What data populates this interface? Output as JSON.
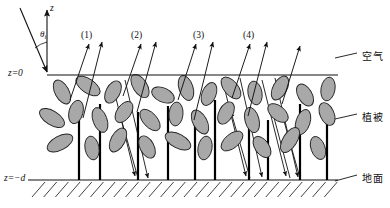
{
  "figure": {
    "type": "schematic-diagram",
    "width": 390,
    "height": 208,
    "background": "#ffffff",
    "stroke_color": "#1a1a1a",
    "leaf_fill": "#a8a8a8",
    "leaf_stroke": "#222222",
    "stem_color": "#000000"
  },
  "axis": {
    "z_label": "z",
    "z_axis_arrow": "up-arrow-icon",
    "angle_label": "θ",
    "angle_subscript": "i",
    "z_zero_label": "z=0",
    "z_zero_label_parts": {
      "var": "z",
      "eq": "=",
      "val": "0"
    },
    "z_depth_label": "z=−d",
    "z_depth_label_parts": {
      "var": "z",
      "eq": "=",
      "val": "−d"
    },
    "z_zero_y": 75,
    "z_depth_y": 180,
    "origin_x": 47
  },
  "ray_labels": [
    {
      "id": "ray-1",
      "text": "(1)",
      "x": 81,
      "y": 31
    },
    {
      "id": "ray-2",
      "text": "(2)",
      "x": 131,
      "y": 31
    },
    {
      "id": "ray-3",
      "text": "(3)",
      "x": 193,
      "y": 31
    },
    {
      "id": "ray-4",
      "text": "(4)",
      "x": 243,
      "y": 31
    }
  ],
  "region_labels": [
    {
      "id": "region-air",
      "text": "空气",
      "x": 362,
      "y": 52,
      "leader_from": [
        335,
        58
      ],
      "leader_to": [
        357,
        53
      ]
    },
    {
      "id": "region-vegetation",
      "text": "植被",
      "x": 362,
      "y": 113,
      "leader_from": [
        335,
        119
      ],
      "leader_to": [
        357,
        114
      ]
    },
    {
      "id": "region-ground",
      "text": "地面",
      "x": 362,
      "y": 174,
      "leader_from": [
        335,
        181
      ],
      "leader_to": [
        357,
        175
      ]
    }
  ],
  "boundaries": {
    "canopy_top_line": {
      "x1": 47,
      "y1": 75,
      "x2": 338,
      "y2": 75
    },
    "ground_line": {
      "x1": 28,
      "y1": 180,
      "x2": 338,
      "y2": 180
    },
    "hatch_count": 26,
    "hatch_angle_deg": 45
  },
  "incident_ray": {
    "from": [
      20,
      8
    ],
    "to": [
      47,
      72
    ],
    "arrowhead": "down-right",
    "description": "incident solar beam at zenith angle theta_i"
  },
  "z_axis_ray": {
    "from": [
      47,
      72
    ],
    "to": [
      47,
      10
    ],
    "arrowhead": "up"
  },
  "stems": [
    {
      "x": 79,
      "y_top": 110,
      "y_bottom": 180
    },
    {
      "x": 100,
      "y_top": 104,
      "y_bottom": 180
    },
    {
      "x": 138,
      "y_top": 112,
      "y_bottom": 180
    },
    {
      "x": 168,
      "y_top": 106,
      "y_bottom": 180
    },
    {
      "x": 195,
      "y_top": 118,
      "y_bottom": 180
    },
    {
      "x": 215,
      "y_top": 100,
      "y_bottom": 180
    },
    {
      "x": 249,
      "y_top": 110,
      "y_bottom": 180
    },
    {
      "x": 268,
      "y_top": 120,
      "y_bottom": 180
    },
    {
      "x": 300,
      "y_top": 104,
      "y_bottom": 180
    },
    {
      "x": 327,
      "y_top": 116,
      "y_bottom": 180
    }
  ],
  "leaves": [
    {
      "cx": 62,
      "cy": 92,
      "rx": 13,
      "ry": 7,
      "rot": 62
    },
    {
      "cx": 88,
      "cy": 86,
      "rx": 14,
      "ry": 7,
      "rot": 35
    },
    {
      "cx": 113,
      "cy": 92,
      "rx": 12,
      "ry": 7,
      "rot": 118
    },
    {
      "cx": 140,
      "cy": 86,
      "rx": 13,
      "ry": 7,
      "rot": 58
    },
    {
      "cx": 163,
      "cy": 95,
      "rx": 12,
      "ry": 7,
      "rot": 25
    },
    {
      "cx": 186,
      "cy": 88,
      "rx": 13,
      "ry": 7,
      "rot": 72
    },
    {
      "cx": 209,
      "cy": 94,
      "rx": 12,
      "ry": 7,
      "rot": 112
    },
    {
      "cx": 231,
      "cy": 88,
      "rx": 13,
      "ry": 7,
      "rot": 50
    },
    {
      "cx": 255,
      "cy": 93,
      "rx": 12,
      "ry": 7,
      "rot": 80
    },
    {
      "cx": 280,
      "cy": 88,
      "rx": 13,
      "ry": 7,
      "rot": 118
    },
    {
      "cx": 305,
      "cy": 95,
      "rx": 12,
      "ry": 7,
      "rot": 60
    },
    {
      "cx": 328,
      "cy": 89,
      "rx": 12,
      "ry": 7,
      "rot": 100
    },
    {
      "cx": 52,
      "cy": 118,
      "rx": 14,
      "ry": 7,
      "rot": 32
    },
    {
      "cx": 76,
      "cy": 112,
      "rx": 12,
      "ry": 7,
      "rot": 105
    },
    {
      "cx": 100,
      "cy": 120,
      "rx": 13,
      "ry": 7,
      "rot": 70
    },
    {
      "cx": 124,
      "cy": 112,
      "rx": 12,
      "ry": 7,
      "rot": 125
    },
    {
      "cx": 150,
      "cy": 120,
      "rx": 13,
      "ry": 7,
      "rot": 48
    },
    {
      "cx": 176,
      "cy": 114,
      "rx": 12,
      "ry": 7,
      "rot": 95
    },
    {
      "cx": 200,
      "cy": 122,
      "rx": 13,
      "ry": 7,
      "rot": 62
    },
    {
      "cx": 226,
      "cy": 113,
      "rx": 12,
      "ry": 7,
      "rot": 118
    },
    {
      "cx": 252,
      "cy": 120,
      "rx": 13,
      "ry": 7,
      "rot": 75
    },
    {
      "cx": 278,
      "cy": 113,
      "rx": 12,
      "ry": 7,
      "rot": 40
    },
    {
      "cx": 303,
      "cy": 122,
      "rx": 13,
      "ry": 7,
      "rot": 108
    },
    {
      "cx": 327,
      "cy": 114,
      "rx": 12,
      "ry": 7,
      "rot": 66
    },
    {
      "cx": 60,
      "cy": 143,
      "rx": 14,
      "ry": 7,
      "rot": 152
    },
    {
      "cx": 92,
      "cy": 148,
      "rx": 12,
      "ry": 7,
      "rot": 80
    },
    {
      "cx": 118,
      "cy": 140,
      "rx": 13,
      "ry": 7,
      "rot": 118
    },
    {
      "cx": 147,
      "cy": 147,
      "rx": 12,
      "ry": 7,
      "rot": 62
    },
    {
      "cx": 178,
      "cy": 141,
      "rx": 14,
      "ry": 7,
      "rot": 28
    },
    {
      "cx": 205,
      "cy": 148,
      "rx": 12,
      "ry": 7,
      "rot": 100
    },
    {
      "cx": 232,
      "cy": 141,
      "rx": 13,
      "ry": 7,
      "rot": 140
    },
    {
      "cx": 262,
      "cy": 147,
      "rx": 12,
      "ry": 7,
      "rot": 55
    },
    {
      "cx": 290,
      "cy": 140,
      "rx": 14,
      "ry": 7,
      "rot": 122
    },
    {
      "cx": 318,
      "cy": 148,
      "rx": 12,
      "ry": 7,
      "rot": 70
    }
  ],
  "scattered_rays": [
    {
      "id": "up-a",
      "points": [
        [
          70,
          100
        ],
        [
          89,
          44
        ]
      ],
      "arrow": "up"
    },
    {
      "id": "up-b",
      "points": [
        [
          83,
          118
        ],
        [
          102,
          42
        ]
      ],
      "arrow": "up"
    },
    {
      "id": "up-c",
      "points": [
        [
          123,
          96
        ],
        [
          141,
          44
        ]
      ],
      "arrow": "up"
    },
    {
      "id": "up-d",
      "points": [
        [
          137,
          112
        ],
        [
          156,
          42
        ]
      ],
      "arrow": "up"
    },
    {
      "id": "up-e",
      "points": [
        [
          178,
          100
        ],
        [
          196,
          44
        ]
      ],
      "arrow": "up"
    },
    {
      "id": "up-f",
      "points": [
        [
          194,
          120
        ],
        [
          213,
          42
        ]
      ],
      "arrow": "up"
    },
    {
      "id": "up-g",
      "points": [
        [
          232,
          98
        ],
        [
          250,
          44
        ]
      ],
      "arrow": "up"
    },
    {
      "id": "up-h",
      "points": [
        [
          248,
          116
        ],
        [
          267,
          42
        ]
      ],
      "arrow": "up"
    },
    {
      "id": "up-i",
      "points": [
        [
          282,
          104
        ],
        [
          300,
          46
        ]
      ],
      "arrow": "up"
    }
  ],
  "ground_bounce_rays": [
    {
      "id": "bounce-1",
      "points": [
        [
          112,
          82
        ],
        [
          135,
          176
        ]
      ],
      "arrow": "down"
    },
    {
      "id": "bounce-2",
      "points": [
        [
          125,
          80
        ],
        [
          148,
          178
        ]
      ],
      "arrow": "down"
    },
    {
      "id": "bounce-3",
      "points": [
        [
          222,
          78
        ],
        [
          246,
          176
        ]
      ],
      "arrow": "down"
    },
    {
      "id": "bounce-4",
      "points": [
        [
          240,
          78
        ],
        [
          262,
          177
        ]
      ],
      "arrow": "down"
    },
    {
      "id": "bounce-5",
      "points": [
        [
          262,
          80
        ],
        [
          286,
          176
        ]
      ],
      "arrow": "down"
    },
    {
      "id": "bounce-6",
      "points": [
        [
          275,
          78
        ],
        [
          298,
          177
        ]
      ],
      "arrow": "down"
    },
    {
      "id": "up-from-ground-1",
      "points": [
        [
          138,
          178
        ],
        [
          118,
          108
        ]
      ],
      "arrow": "up"
    },
    {
      "id": "up-from-ground-2",
      "points": [
        [
          250,
          178
        ],
        [
          231,
          112
        ]
      ],
      "arrow": "up"
    },
    {
      "id": "up-from-ground-3",
      "points": [
        [
          290,
          178
        ],
        [
          272,
          110
        ]
      ],
      "arrow": "up"
    },
    {
      "id": "up-from-ground-4",
      "points": [
        [
          300,
          178
        ],
        [
          282,
          114
        ]
      ],
      "arrow": "up"
    }
  ]
}
